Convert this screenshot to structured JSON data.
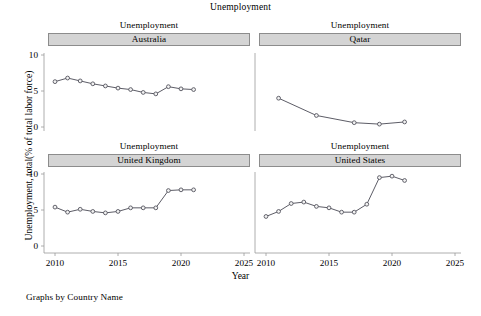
{
  "figure": {
    "title": "Unemployment",
    "ylabel": "Unemployment, total(% of total labor force)",
    "xlabel": "Year",
    "footer": "Graphs by Country Name",
    "subtitle_each": "Unemployment"
  },
  "axes": {
    "ytick_labels": [
      "10",
      "5",
      "0"
    ],
    "xtick_labels": [
      "2010",
      "2015",
      "2020",
      "2025"
    ],
    "ylim": [
      0,
      10
    ],
    "xlim": [
      2009,
      2026
    ]
  },
  "chart_data": {
    "type": "line",
    "title": "Unemployment",
    "xlabel": "Year",
    "ylabel": "Unemployment, total(% of total labor force)",
    "xlim": [
      2009,
      2026
    ],
    "ylim": [
      0,
      10
    ],
    "xticks": [
      2010,
      2015,
      2020,
      2025
    ],
    "yticks": [
      0,
      5,
      10
    ],
    "grid": false,
    "legend": "none",
    "layout": "2x2 small multiples by Country Name",
    "panels": [
      {
        "name": "Australia",
        "subtitle": "Unemployment",
        "position": "top-left",
        "x": [
          2010,
          2011,
          2012,
          2013,
          2014,
          2015,
          2016,
          2017,
          2018,
          2019,
          2020,
          2021
        ],
        "y": [
          6.3,
          6.8,
          6.4,
          6.0,
          5.7,
          5.4,
          5.2,
          4.8,
          4.6,
          5.6,
          5.3,
          5.2
        ]
      },
      {
        "name": "Qatar",
        "subtitle": "Unemployment",
        "position": "top-right",
        "x": [
          2011,
          2014,
          2017,
          2019,
          2021
        ],
        "y": [
          4.0,
          1.6,
          0.6,
          0.4,
          0.7
        ]
      },
      {
        "name": "United Kingdom",
        "subtitle": "Unemployment",
        "position": "bottom-left",
        "x": [
          2010,
          2011,
          2012,
          2013,
          2014,
          2015,
          2016,
          2017,
          2018,
          2019,
          2020,
          2021
        ],
        "y": [
          5.4,
          4.7,
          5.1,
          4.8,
          4.6,
          4.8,
          5.3,
          5.3,
          5.3,
          7.7,
          7.8,
          7.8
        ]
      },
      {
        "name": "United States",
        "subtitle": "Unemployment",
        "position": "bottom-right",
        "x": [
          2010,
          2011,
          2012,
          2013,
          2014,
          2015,
          2016,
          2017,
          2018,
          2019,
          2020,
          2021
        ],
        "y": [
          4.1,
          4.8,
          5.9,
          6.1,
          5.5,
          5.3,
          4.7,
          4.7,
          5.8,
          9.5,
          9.7,
          9.1
        ]
      }
    ]
  }
}
